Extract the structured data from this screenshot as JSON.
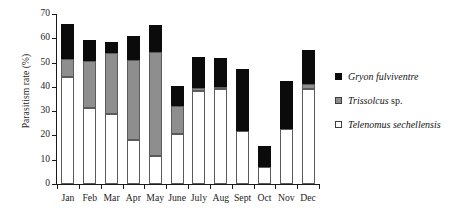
{
  "chart_data": {
    "type": "bar",
    "subtype": "stacked-vertical",
    "title": "",
    "xlabel": "",
    "ylabel": "Parasitism rate (%)",
    "ylim": [
      0,
      70
    ],
    "ytick_values": [
      0,
      10,
      20,
      30,
      40,
      50,
      60,
      70
    ],
    "ytick_labels": [
      "0",
      "10",
      "20",
      "30",
      "40",
      "50",
      "60",
      "70"
    ],
    "grid": false,
    "legend_position": "right",
    "categories": [
      "Jan",
      "Feb",
      "Mar",
      "Apr",
      "May",
      "June",
      "July",
      "Aug",
      "Sept",
      "Oct",
      "Nov",
      "Dec"
    ],
    "series": [
      {
        "name": "Telenomus sechellensis",
        "style": "italic",
        "color": "#ffffff",
        "edge_color": "#5b5b5b",
        "swatch": "open-square",
        "values": [
          44,
          31.5,
          29,
          18,
          11.5,
          20.5,
          38.5,
          39,
          22,
          7,
          22.5,
          39
        ]
      },
      {
        "name": "Trissolcus sp.",
        "style": "italic-genus-roman-sp",
        "color": "#8e8e8e",
        "edge_color": "#5b5b5b",
        "swatch": "gray-square",
        "values": [
          7.5,
          19,
          25,
          33,
          43,
          11.5,
          1,
          1,
          0,
          0,
          0,
          2
        ]
      },
      {
        "name": "Gryon fulviventre",
        "style": "italic",
        "color": "#0b0b0b",
        "edge_color": "#0b0b0b",
        "swatch": "filled-square",
        "values": [
          14.5,
          9,
          4.5,
          10,
          11,
          8.5,
          13,
          12,
          25.5,
          8.5,
          20,
          14
        ]
      }
    ],
    "cumulative_tops": {
      "Telenomus sechellensis": [
        44,
        31.5,
        29,
        18,
        11.5,
        20.5,
        38.5,
        39,
        22,
        7,
        22.5,
        39
      ],
      "Trissolcus sp.": [
        51.5,
        50.5,
        54,
        51,
        54.5,
        32,
        39.5,
        40,
        22,
        7,
        22.5,
        41
      ],
      "Gryon fulviventre": [
        66,
        59.5,
        58.5,
        61,
        65.5,
        40.5,
        52.5,
        52,
        47.5,
        15.5,
        42.5,
        55
      ]
    },
    "totals": [
      66,
      59.5,
      58.5,
      61,
      65.5,
      40.5,
      52.5,
      52,
      47.5,
      15.5,
      42.5,
      55
    ]
  },
  "legend": {
    "entries": [
      {
        "genus": "Gryon fulviventre",
        "roman_suffix": ""
      },
      {
        "genus": "Trissolcus",
        "roman_suffix": " sp."
      },
      {
        "genus": "Telenomus sechellensis",
        "roman_suffix": ""
      }
    ]
  }
}
